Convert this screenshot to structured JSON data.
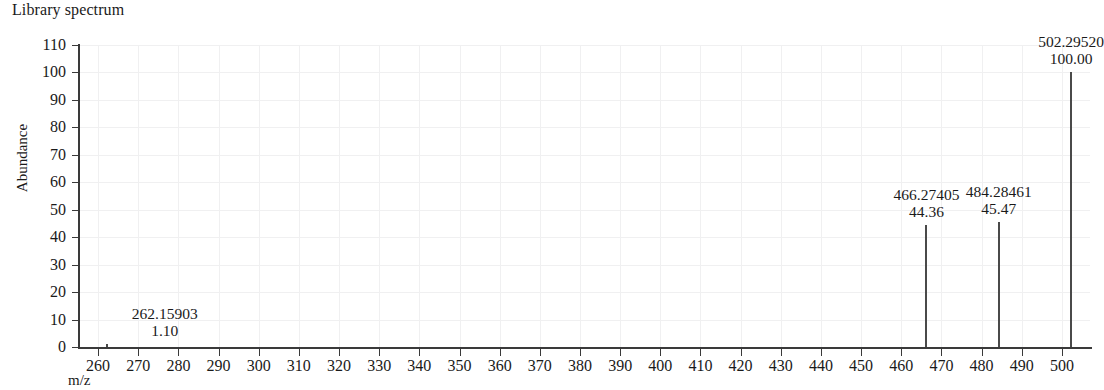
{
  "figure": {
    "title": "Library spectrum",
    "y_axis_title": "Abundance",
    "x_axis_title": "m/z"
  },
  "chart_data": {
    "type": "bar",
    "title": "Library spectrum",
    "xlabel": "m/z",
    "ylabel": "Abundance",
    "xlim": [
      255,
      507
    ],
    "ylim": [
      0,
      110
    ],
    "xticks": [
      260,
      270,
      280,
      290,
      300,
      310,
      320,
      330,
      340,
      350,
      360,
      370,
      380,
      390,
      400,
      410,
      420,
      430,
      440,
      450,
      460,
      470,
      480,
      490,
      500
    ],
    "yticks": [
      0,
      10,
      20,
      30,
      40,
      50,
      60,
      70,
      80,
      90,
      100,
      110
    ],
    "grid": true,
    "legend": null,
    "peaks": [
      {
        "mz": 262.15903,
        "intensity": 1.1,
        "mz_label": "262.15903",
        "intensity_label": "1.10",
        "label_side": "right"
      },
      {
        "mz": 466.27405,
        "intensity": 44.36,
        "mz_label": "466.27405",
        "intensity_label": "44.36",
        "label_side": "center"
      },
      {
        "mz": 484.28461,
        "intensity": 45.47,
        "mz_label": "484.28461",
        "intensity_label": "45.47",
        "label_side": "center"
      },
      {
        "mz": 502.2952,
        "intensity": 100.0,
        "mz_label": "502.29520",
        "intensity_label": "100.00",
        "label_side": "center"
      }
    ]
  }
}
